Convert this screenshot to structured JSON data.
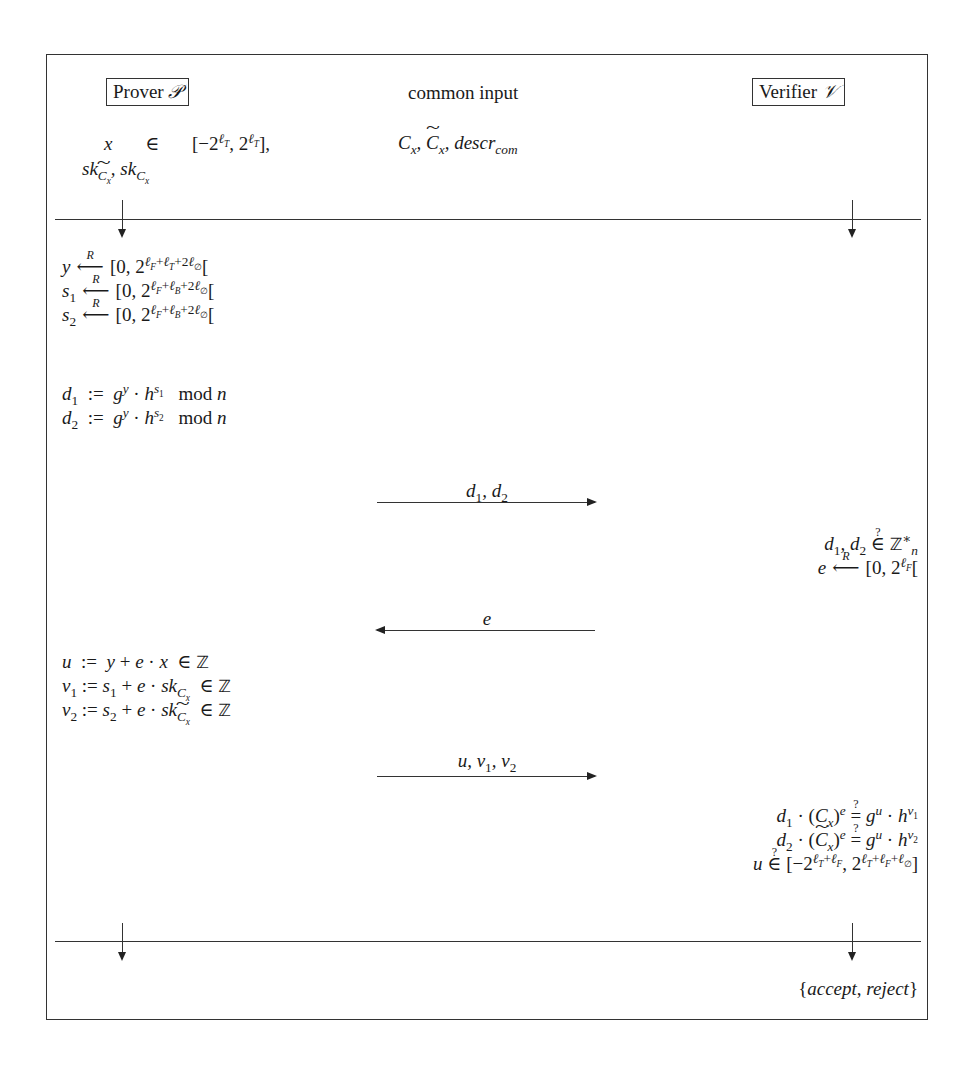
{
  "diagram": {
    "type": "protocol-diagram",
    "parties": {
      "prover": {
        "label": "Prover",
        "symbol": "𝒫"
      },
      "common": {
        "label": "common input"
      },
      "verifier": {
        "label": "Verifier",
        "symbol": "𝒱"
      }
    },
    "inputs": {
      "prover_line1": {
        "var": "x",
        "rel": "∈",
        "range": "[−2^{ℓT}, 2^{ℓT}],",
        "range_open": "[−2",
        "exp": "ℓ",
        "exp_sub": "T",
        "mid": ", 2",
        "close": "],"
      },
      "prover_line2": "sk_{C̃x}, sk_{Cx}",
      "common_line": "Cx, C̃x, descr_com"
    },
    "prover_step1": [
      {
        "lhs": "y",
        "rhs": "[0, 2^{ℓF+ℓT+2ℓ∅}[",
        "exp_text": "ℓF+ℓT+2ℓ∅"
      },
      {
        "lhs": "s1",
        "rhs": "[0, 2^{ℓF+ℓB+2ℓ∅}[",
        "exp_text": "ℓF+ℓB+2ℓ∅"
      },
      {
        "lhs": "s2",
        "rhs": "[0, 2^{ℓF+ℓB+2ℓ∅}[",
        "exp_text": "ℓF+ℓB+2ℓ∅"
      }
    ],
    "random_label": "R",
    "prover_step2": [
      {
        "lhs": "d1",
        "rhs": "g^y · h^{s1} mod n"
      },
      {
        "lhs": "d2",
        "rhs": "g^y · h^{s2} mod n"
      }
    ],
    "mod_label": "mod",
    "messages": [
      {
        "label": "d1, d2",
        "direction": "prover-to-verifier"
      },
      {
        "label": "e",
        "direction": "verifier-to-prover"
      },
      {
        "label": "u, v1, v2",
        "direction": "prover-to-verifier"
      }
    ],
    "verifier_step1": [
      "d1, d2 ∈? ℤn*",
      "e ←R [0, 2^{ℓF}["
    ],
    "prover_step3": [
      "u := y + e · x ∈ ℤ",
      "v1 := s1 + e · sk_{Cx} ∈ ℤ",
      "v2 := s2 + e · sk_{C̃x} ∈ ℤ"
    ],
    "verifier_step2": [
      "d1 · (Cx)^e =? g^u · h^{v1}",
      "d2 · (C̃x)^e =? g^u · h^{v2}",
      "u ∈? [−2^{ℓT+ℓF}, 2^{ℓT+ℓF+ℓ∅}]"
    ],
    "output": "{accept, reject}",
    "output_parts": {
      "open": "{",
      "accept": "accept",
      "sep": ", ",
      "reject": "reject",
      "close": "}"
    }
  }
}
